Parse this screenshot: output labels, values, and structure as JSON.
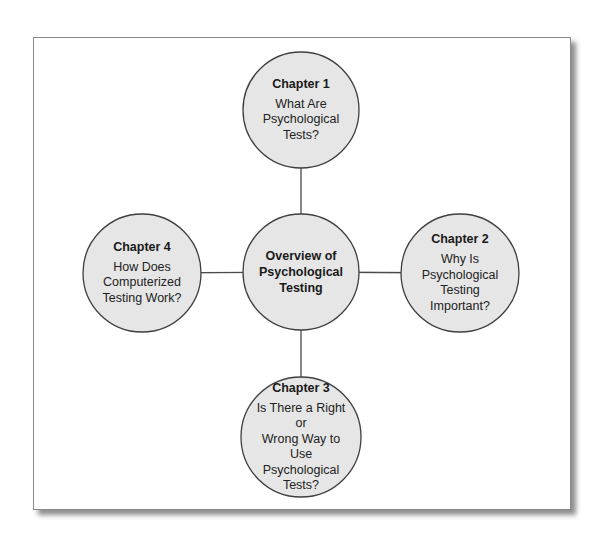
{
  "diagram": {
    "center": {
      "title": "Overview of Psychological Testing",
      "title_lines": [
        "Overview of",
        "Psychological",
        "Testing"
      ]
    },
    "nodes": [
      {
        "id": "chapter-1",
        "position": "top",
        "title": "Chapter 1",
        "body_lines": [
          "What Are",
          "Psychological",
          "Tests?"
        ]
      },
      {
        "id": "chapter-2",
        "position": "right",
        "title": "Chapter 2",
        "body_lines": [
          "Why Is",
          "Psychological",
          "Testing",
          "Important?"
        ]
      },
      {
        "id": "chapter-3",
        "position": "bottom",
        "title": "Chapter 3",
        "body_lines": [
          "Is There a Right or",
          "Wrong Way to Use",
          "Psychological",
          "Tests?"
        ]
      },
      {
        "id": "chapter-4",
        "position": "left",
        "title": "Chapter 4",
        "body_lines": [
          "How Does",
          "Computerized",
          "Testing Work?"
        ]
      }
    ],
    "edges": [
      {
        "from": "center",
        "to": "chapter-1"
      },
      {
        "from": "center",
        "to": "chapter-2"
      },
      {
        "from": "center",
        "to": "chapter-3"
      },
      {
        "from": "center",
        "to": "chapter-4"
      }
    ],
    "colors": {
      "node_fill": "#e6e6e6",
      "node_stroke": "#3f3f3f",
      "edge": "#4a4a4a",
      "frame_border": "#8a8a8a"
    }
  }
}
